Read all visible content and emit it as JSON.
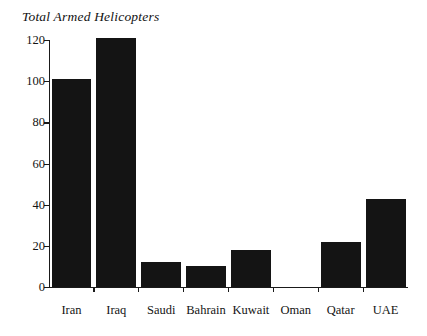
{
  "chart_data": {
    "type": "bar",
    "title": "Total Armed Helicopters",
    "xlabel": "",
    "ylabel": "",
    "categories": [
      "Iran",
      "Iraq",
      "Saudi",
      "Bahrain",
      "Kuwait",
      "Oman",
      "Qatar",
      "UAE"
    ],
    "values": [
      101,
      121,
      12,
      10,
      18,
      0,
      22,
      43
    ],
    "ylim": [
      0,
      120
    ],
    "ytick_labels": [
      "0",
      "20",
      "40",
      "60",
      "80",
      "100",
      "120"
    ],
    "ytick_values": [
      0,
      20,
      40,
      60,
      80,
      100,
      120
    ],
    "grid": false,
    "legend": null,
    "bar_color": "#141414",
    "axis_color": "#1a1a1a",
    "background_color": "#ffffff"
  }
}
